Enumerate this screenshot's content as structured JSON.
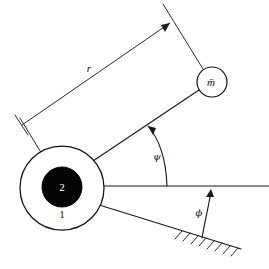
{
  "figure": {
    "background_color": "#ffffff",
    "line_color": "#1a1a1a",
    "fill_color": "#050505",
    "labels": {
      "radius_dimension": "r",
      "rod_angle": "ψ",
      "incline_angle": "ϕ",
      "point_mass": "m̄",
      "body_outer": "1",
      "body_inner": "2"
    },
    "elements": [
      {
        "name": "outer-cylinder",
        "kind": "circle",
        "label": "1",
        "center": [
          62,
          188
        ],
        "radius": 42,
        "fill": "#ffffff",
        "stroke": "#111111"
      },
      {
        "name": "inner-mass-disc",
        "kind": "circle",
        "label": "2",
        "center": [
          62,
          187
        ],
        "radius": 20,
        "fill": "#050505",
        "stroke": "#050505"
      },
      {
        "name": "point-mass",
        "kind": "circle",
        "label": "m̄",
        "center": [
          212,
          82
        ],
        "radius": 15,
        "fill": "#ffffff",
        "stroke": "#111111"
      },
      {
        "name": "rod",
        "kind": "line",
        "from": [
          93,
          160
        ],
        "to": [
          198,
          90
        ]
      },
      {
        "name": "horizontal-reference-line",
        "kind": "line",
        "from": [
          100,
          186
        ],
        "to": [
          269,
          186
        ]
      },
      {
        "name": "inclined-ground-line",
        "kind": "line",
        "from": [
          96,
          204
        ],
        "to": [
          240,
          249
        ]
      },
      {
        "name": "radius-dimension-line",
        "kind": "dimension",
        "from": [
          22,
          123
        ],
        "to": [
          168,
          24
        ],
        "label": "r"
      },
      {
        "name": "rod-angle-arc",
        "kind": "arc",
        "label": "ψ",
        "vertex": [
          168,
          186
        ],
        "from_deg": 0,
        "to_deg": 33
      },
      {
        "name": "incline-angle-arc",
        "kind": "arc",
        "label": "ϕ",
        "vertex": [
          201,
          238
        ],
        "from_deg": 17,
        "to_deg": 90
      }
    ]
  }
}
